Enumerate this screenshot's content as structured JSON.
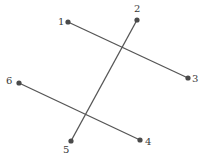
{
  "diagram": {
    "line_color": "#555555",
    "point_color": "#4a4a4a",
    "points": [
      {
        "id": "1",
        "label": "1",
        "x": 68,
        "y": 22,
        "lx": 58,
        "ly": 25
      },
      {
        "id": "2",
        "label": "2",
        "x": 137,
        "y": 20,
        "lx": 134,
        "ly": 12
      },
      {
        "id": "3",
        "label": "3",
        "x": 188,
        "y": 78,
        "lx": 194,
        "ly": 82
      },
      {
        "id": "4",
        "label": "4",
        "x": 140,
        "y": 140,
        "lx": 146,
        "ly": 145
      },
      {
        "id": "5",
        "label": "5",
        "x": 71,
        "y": 141,
        "lx": 63,
        "ly": 153
      },
      {
        "id": "6",
        "label": "6",
        "x": 19,
        "y": 83,
        "lx": 7,
        "ly": 84
      }
    ],
    "segments": [
      {
        "from": "1",
        "to": "3"
      },
      {
        "from": "2",
        "to": "5"
      },
      {
        "from": "6",
        "to": "4"
      }
    ]
  }
}
